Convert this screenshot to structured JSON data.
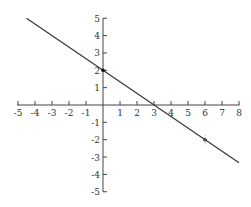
{
  "chart_data": {
    "type": "line",
    "title": "",
    "xlabel": "",
    "ylabel": "",
    "xlim": [
      -5,
      8
    ],
    "ylim": [
      -5,
      5
    ],
    "grid": false,
    "x_ticks": [
      -5,
      -4,
      -3,
      -2,
      -1,
      1,
      2,
      3,
      4,
      5,
      6,
      7,
      8
    ],
    "y_ticks": [
      -5,
      -4,
      -3,
      -2,
      -1,
      1,
      2,
      3,
      4,
      5
    ],
    "series": [
      {
        "name": "line",
        "equation": "y = -2/3 x + 2",
        "x": [
          -4.5,
          8
        ],
        "y": [
          5,
          -3.33
        ]
      }
    ],
    "points": [
      {
        "x": 0,
        "y": 2
      },
      {
        "x": 6,
        "y": -2
      }
    ],
    "x_intercept": 3,
    "y_intercept": 2
  },
  "style": {
    "axis_color": "#444444",
    "line_color": "#333333",
    "point_color": "#111111"
  }
}
